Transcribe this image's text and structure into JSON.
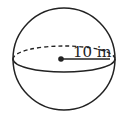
{
  "diagram": {
    "type": "sphere",
    "label": "10 in",
    "radius_value": 10,
    "unit": "in",
    "colors": {
      "stroke": "#222222",
      "background": "#ffffff"
    }
  }
}
